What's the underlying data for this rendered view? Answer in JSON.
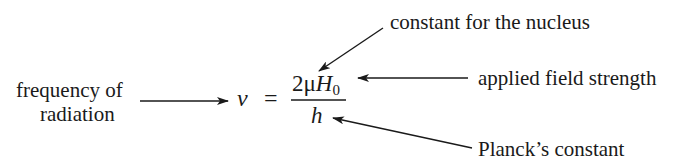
{
  "labels": {
    "frequency_line1": "frequency of",
    "frequency_line2": "radiation",
    "nucleus_constant": "constant for the nucleus",
    "field_strength": "applied field strength",
    "planck": "Planck’s constant"
  },
  "equation": {
    "lhs": "ν",
    "equals": "=",
    "numerator_coeff": "2",
    "numerator_mu": "μ",
    "numerator_H": "H",
    "numerator_H_subscript": "0",
    "denominator": "h"
  },
  "colors": {
    "ink": "#1a1a1a",
    "background": "#ffffff"
  }
}
